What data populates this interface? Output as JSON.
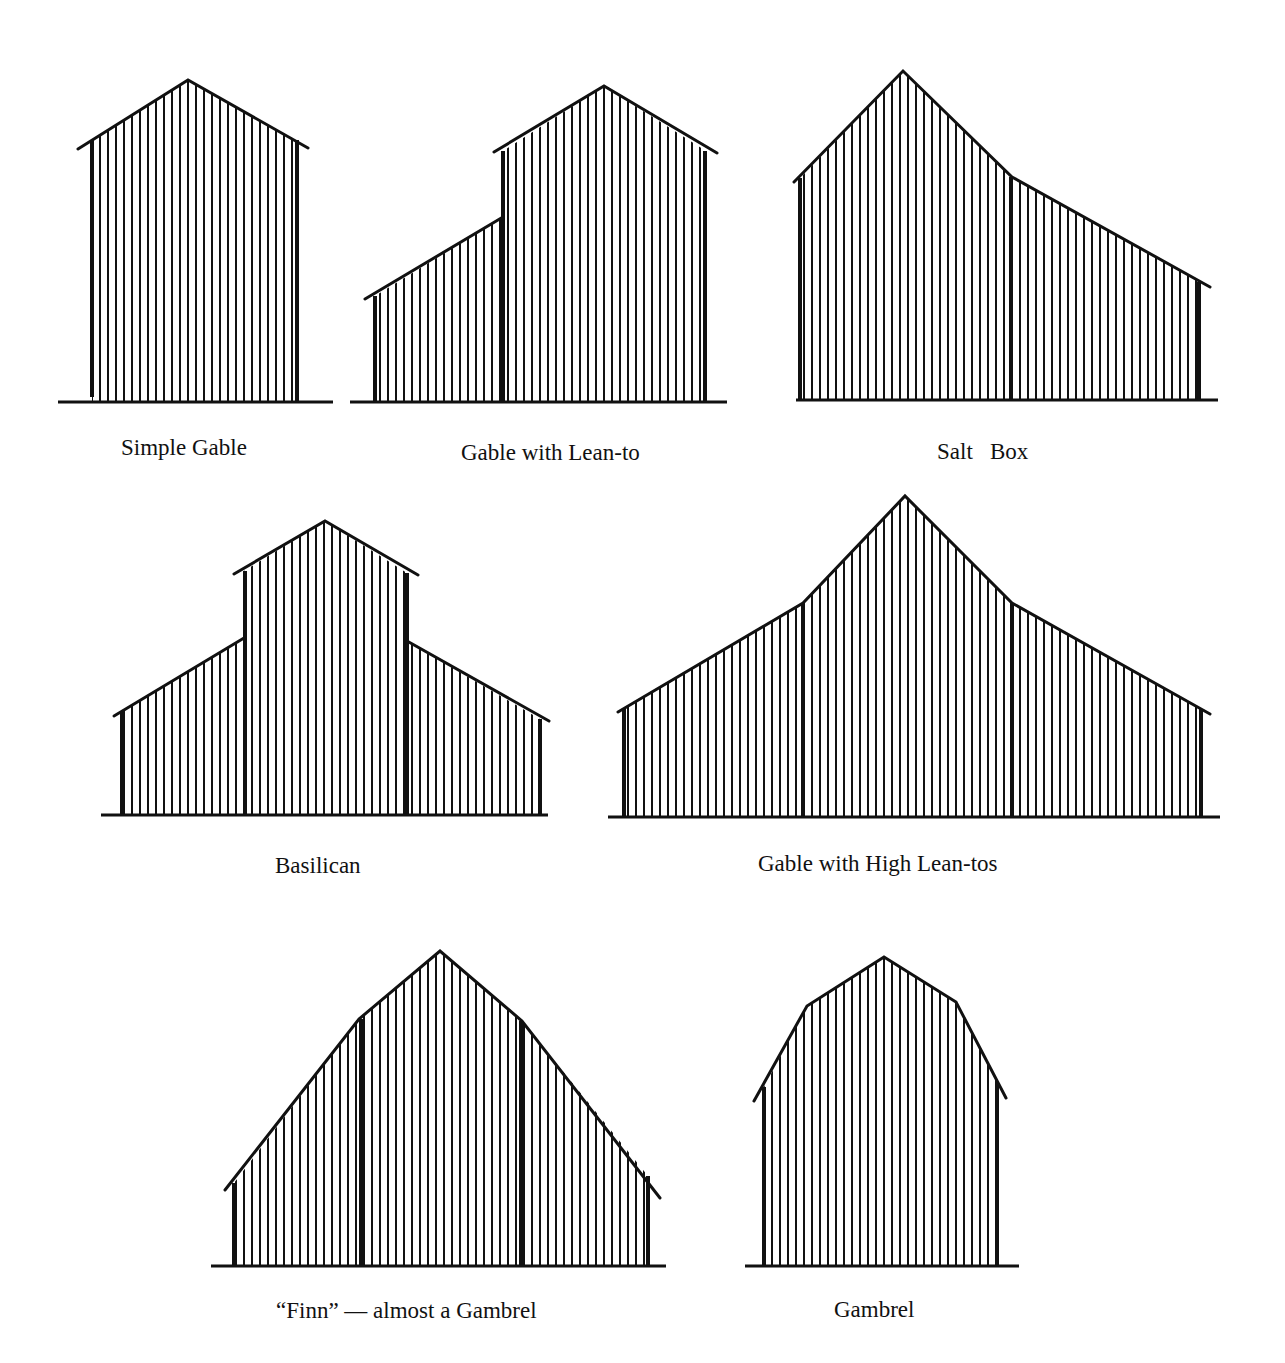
{
  "colors": {
    "ink": "#111111",
    "paper": "#ffffff"
  },
  "stripe_spacing": 8,
  "figures": [
    {
      "id": "simple-gable",
      "label": "Simple Gable",
      "label_pos": [
        121,
        436
      ],
      "ground": [
        [
          58,
          402
        ],
        [
          333,
          402
        ]
      ],
      "outline": [
        [
          92,
          402
        ],
        [
          92,
          140
        ],
        [
          188,
          80
        ],
        [
          296,
          140
        ],
        [
          298,
          402
        ]
      ],
      "eaves": [
        [
          [
            78,
            149
          ],
          [
            188,
            80
          ],
          [
            308,
            148
          ]
        ]
      ],
      "posts": [
        [
          92,
          140,
          397
        ],
        [
          297,
          140,
          402
        ]
      ]
    },
    {
      "id": "gable-with-lean-to",
      "label": "Gable with Lean-to",
      "label_pos": [
        461,
        441
      ],
      "ground": [
        [
          350,
          402
        ],
        [
          727,
          402
        ]
      ],
      "outline": [
        [
          375,
          402
        ],
        [
          375,
          296
        ],
        [
          503,
          217
        ],
        [
          503,
          151
        ],
        [
          604,
          86
        ],
        [
          706,
          151
        ],
        [
          706,
          402
        ]
      ],
      "eaves": [
        [
          [
            365,
            299
          ],
          [
            503,
            217
          ]
        ],
        [
          [
            494,
            152
          ],
          [
            604,
            86
          ],
          [
            717,
            153
          ]
        ]
      ],
      "posts": [
        [
          375,
          296,
          402
        ],
        [
          503,
          151,
          402
        ],
        [
          705,
          151,
          402
        ]
      ]
    },
    {
      "id": "salt-box",
      "label": "Salt   Box",
      "label_pos": [
        937,
        440
      ],
      "ground": [
        [
          796,
          400
        ],
        [
          1218,
          400
        ]
      ],
      "outline": [
        [
          800,
          400
        ],
        [
          800,
          178
        ],
        [
          903,
          71
        ],
        [
          1012,
          177
        ],
        [
          1200,
          282
        ],
        [
          1200,
          400
        ]
      ],
      "eaves": [
        [
          [
            794,
            182
          ],
          [
            903,
            71
          ],
          [
            1012,
            177
          ],
          [
            1210,
            287
          ]
        ]
      ],
      "posts": [
        [
          800,
          178,
          400
        ],
        [
          1011,
          177,
          400
        ],
        [
          1199,
          282,
          400
        ]
      ]
    },
    {
      "id": "basilican",
      "label": "Basilican",
      "label_pos": [
        275,
        854
      ],
      "ground": [
        [
          101,
          815
        ],
        [
          548,
          815
        ]
      ],
      "outline": [
        [
          122,
          815
        ],
        [
          122,
          712
        ],
        [
          244,
          638
        ],
        [
          244,
          571
        ],
        [
          325,
          521
        ],
        [
          407,
          573
        ],
        [
          407,
          641
        ],
        [
          540,
          719
        ],
        [
          540,
          815
        ]
      ],
      "eaves": [
        [
          [
            114,
            716
          ],
          [
            244,
            638
          ]
        ],
        [
          [
            234,
            574
          ],
          [
            325,
            521
          ],
          [
            418,
            575
          ]
        ],
        [
          [
            407,
            641
          ],
          [
            549,
            721
          ]
        ]
      ],
      "posts": [
        [
          122,
          712,
          815
        ],
        [
          245,
          571,
          815
        ],
        [
          407,
          573,
          815
        ],
        [
          540,
          719,
          815
        ]
      ]
    },
    {
      "id": "gable-with-high-lean-tos",
      "label": "Gable with High Lean-tos",
      "label_pos": [
        758,
        852
      ],
      "ground": [
        [
          608,
          817
        ],
        [
          1220,
          817
        ]
      ],
      "outline": [
        [
          624,
          817
        ],
        [
          624,
          708
        ],
        [
          803,
          603
        ],
        [
          905,
          496
        ],
        [
          1012,
          603
        ],
        [
          1201,
          709
        ],
        [
          1201,
          817
        ]
      ],
      "eaves": [
        [
          [
            618,
            712
          ],
          [
            803,
            603
          ],
          [
            905,
            496
          ],
          [
            1012,
            603
          ],
          [
            1210,
            714
          ]
        ]
      ],
      "posts": [
        [
          624,
          708,
          817
        ],
        [
          803,
          603,
          817
        ],
        [
          1012,
          603,
          817
        ],
        [
          1201,
          709,
          817
        ]
      ]
    },
    {
      "id": "finn-almost-gambrel",
      "label": "“Finn” — almost a Gambrel",
      "label_pos": [
        276,
        1299
      ],
      "ground": [
        [
          211,
          1266
        ],
        [
          666,
          1266
        ]
      ],
      "outline": [
        [
          234,
          1266
        ],
        [
          234,
          1183
        ],
        [
          359,
          1019
        ],
        [
          440,
          951
        ],
        [
          522,
          1021
        ],
        [
          648,
          1176
        ],
        [
          648,
          1266
        ]
      ],
      "eaves": [
        [
          [
            225,
            1190
          ],
          [
            359,
            1019
          ],
          [
            440,
            951
          ],
          [
            522,
            1021
          ],
          [
            660,
            1198
          ]
        ]
      ],
      "posts": [
        [
          234,
          1183,
          1266
        ],
        [
          361,
          1019,
          1266
        ],
        [
          521,
          1021,
          1266
        ],
        [
          648,
          1176,
          1266
        ]
      ]
    },
    {
      "id": "gambrel",
      "label": "Gambrel",
      "label_pos": [
        834,
        1298
      ],
      "ground": [
        [
          745,
          1266
        ],
        [
          1019,
          1266
        ]
      ],
      "outline": [
        [
          764,
          1266
        ],
        [
          764,
          1087
        ],
        [
          807,
          1006
        ],
        [
          884,
          957
        ],
        [
          956,
          1002
        ],
        [
          998,
          1083
        ],
        [
          998,
          1266
        ]
      ],
      "eaves": [
        [
          [
            754,
            1101
          ],
          [
            807,
            1006
          ],
          [
            884,
            957
          ],
          [
            956,
            1002
          ],
          [
            1006,
            1098
          ]
        ]
      ],
      "posts": [
        [
          764,
          1087,
          1266
        ],
        [
          997,
          1083,
          1266
        ]
      ]
    }
  ]
}
